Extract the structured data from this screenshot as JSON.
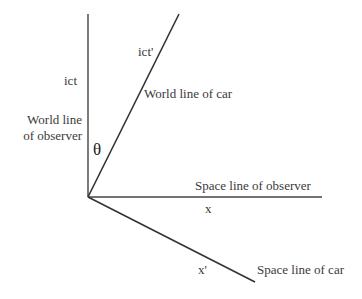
{
  "diagram": {
    "title": "",
    "line_color": "#333333",
    "labels": {
      "ict": "ict",
      "ict_prime": "ict'",
      "world_line_car": "World line of car",
      "world_line_observer_1": "World line",
      "world_line_observer_2": "of observer",
      "theta": "θ",
      "space_line_observer": "Space line of observer",
      "x": "x",
      "x_prime": "x'",
      "space_line_car": "Space line of car"
    },
    "lines": [
      {
        "name": "world-line-of-observer",
        "from": [
          88,
          197
        ],
        "to": [
          88,
          14
        ]
      },
      {
        "name": "world-line-of-car",
        "from": [
          88,
          197
        ],
        "to": [
          179,
          14
        ]
      },
      {
        "name": "space-line-of-observer",
        "from": [
          88,
          197
        ],
        "to": [
          322,
          197
        ]
      },
      {
        "name": "space-line-of-car",
        "from": [
          88,
          197
        ],
        "to": [
          255,
          282
        ]
      }
    ]
  }
}
